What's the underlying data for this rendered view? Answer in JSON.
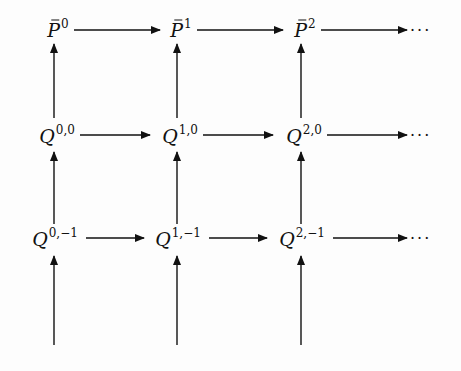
{
  "diagram": {
    "type": "commutative-grid",
    "rows": [
      {
        "name": "P-bar row",
        "nodes": [
          {
            "base": "P",
            "bar": true,
            "sup": "0"
          },
          {
            "base": "P",
            "bar": true,
            "sup": "1"
          },
          {
            "base": "P",
            "bar": true,
            "sup": "2"
          }
        ],
        "continuation": "···"
      },
      {
        "name": "Q row level 0",
        "nodes": [
          {
            "base": "Q",
            "bar": false,
            "sup": "0,0"
          },
          {
            "base": "Q",
            "bar": false,
            "sup": "1,0"
          },
          {
            "base": "Q",
            "bar": false,
            "sup": "2,0"
          }
        ],
        "continuation": "···"
      },
      {
        "name": "Q row level -1",
        "nodes": [
          {
            "base": "Q",
            "bar": false,
            "sup": "0,−1"
          },
          {
            "base": "Q",
            "bar": false,
            "sup": "1,−1"
          },
          {
            "base": "Q",
            "bar": false,
            "sup": "2,−1"
          }
        ],
        "continuation": "···"
      }
    ],
    "arrows": {
      "horizontal": "each node maps right to next node in its row; last maps to ···",
      "vertical": "each node maps up to node above; bottom row has incoming arrows from below"
    }
  }
}
